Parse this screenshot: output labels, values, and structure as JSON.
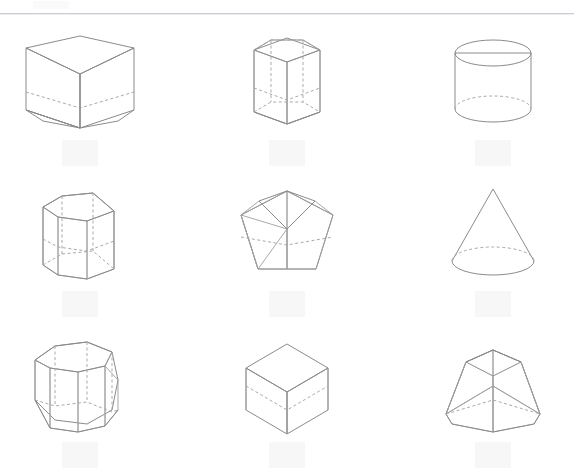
{
  "document": {
    "title": "Geometric Solids",
    "background_color": "#ffffff",
    "rule_color": "#c9ccd1"
  },
  "palette": {
    "outline": "#8b8b8b",
    "hidden_edge": "#a9a9a9",
    "face_light": "#f2f2f2",
    "face_mid": "#c9c9c9",
    "face_dark": "#a6a6a6",
    "face_darker": "#9a9a9a",
    "label_slot": "#f7f7f8"
  },
  "grid": {
    "rows": 3,
    "columns": 3,
    "cells": [
      {
        "position": "row1-col1",
        "shape": "triangular-prism",
        "label": "",
        "orientation": "upright, viewed from above"
      },
      {
        "position": "row1-col2",
        "shape": "pentagonal-prism",
        "label": "",
        "orientation": "upright wireframe, hidden edges dashed"
      },
      {
        "position": "row1-col3",
        "shape": "cylinder",
        "label": "",
        "orientation": "upright, viewed from above"
      },
      {
        "position": "row2-col1",
        "shape": "hexagonal-prism",
        "label": "",
        "orientation": "upright, viewed from above"
      },
      {
        "position": "row2-col2",
        "shape": "pentagonal-prism-flat",
        "label": "",
        "orientation": "short prism, high viewing angle"
      },
      {
        "position": "row2-col3",
        "shape": "cone",
        "label": "",
        "orientation": "upright, apex up"
      },
      {
        "position": "row3-col1",
        "shape": "octagonal-prism",
        "label": "",
        "orientation": "upright, translucent faces"
      },
      {
        "position": "row3-col2",
        "shape": "cube",
        "label": "",
        "orientation": "corner-on isometric view"
      },
      {
        "position": "row3-col3",
        "shape": "square-frustum",
        "label": "",
        "orientation": "truncated pyramid, upright"
      }
    ]
  }
}
